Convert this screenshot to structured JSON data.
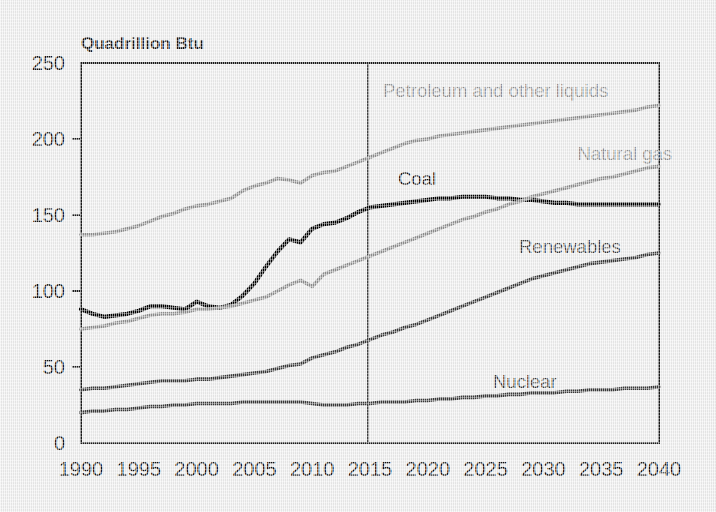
{
  "figure": {
    "axis_title": "Quadrillion Btu",
    "background_color": "#ececec",
    "frame_color": "#1a1a1a"
  },
  "chart_data": {
    "type": "line",
    "title": "Quadrillion Btu",
    "xlabel": "",
    "ylabel": "Quadrillion Btu",
    "xlim": [
      1990,
      2040
    ],
    "ylim": [
      0,
      250
    ],
    "grid": false,
    "legend_position": "inline-annotations",
    "projection_divider_x": 2015,
    "xticks": [
      "1990",
      "1995",
      "2000",
      "2005",
      "2010",
      "2015",
      "2020",
      "2025",
      "2030",
      "2035",
      "2040"
    ],
    "yticks": [
      "0",
      "50",
      "100",
      "150",
      "200",
      "250"
    ],
    "x": [
      1990,
      1991,
      1992,
      1993,
      1994,
      1995,
      1996,
      1997,
      1998,
      1999,
      2000,
      2001,
      2002,
      2003,
      2004,
      2005,
      2006,
      2007,
      2008,
      2009,
      2010,
      2011,
      2012,
      2013,
      2014,
      2015,
      2016,
      2017,
      2018,
      2019,
      2020,
      2021,
      2022,
      2023,
      2024,
      2025,
      2026,
      2027,
      2028,
      2029,
      2030,
      2031,
      2032,
      2033,
      2034,
      2035,
      2036,
      2037,
      2038,
      2039,
      2040
    ],
    "series": [
      {
        "name": "Petroleum and other liquids",
        "label": "Petroleum and other liquids",
        "color": "#8f8f8f",
        "label_x": 383,
        "label_y": 97,
        "label_anchor": "start",
        "values": [
          137,
          137,
          138,
          139,
          141,
          143,
          146,
          149,
          151,
          154,
          156,
          157,
          159,
          161,
          166,
          169,
          171,
          174,
          173,
          171,
          176,
          178,
          179,
          182,
          185,
          188,
          191,
          194,
          197,
          199,
          200,
          202,
          203,
          204,
          205,
          206,
          207,
          208,
          209,
          210,
          211,
          212,
          213,
          214,
          215,
          216,
          217,
          218,
          219,
          221,
          222
        ]
      },
      {
        "name": "Coal",
        "label": "Coal",
        "color": "#000000",
        "label_x": 398,
        "label_y": 185,
        "label_anchor": "start",
        "values": [
          88,
          85,
          83,
          84,
          85,
          87,
          90,
          90,
          89,
          88,
          93,
          90,
          89,
          91,
          97,
          105,
          116,
          126,
          134,
          132,
          141,
          144,
          145,
          148,
          152,
          155,
          156,
          157,
          158,
          159,
          160,
          161,
          161,
          162,
          162,
          162,
          161,
          161,
          160,
          160,
          159,
          158,
          158,
          157,
          157,
          157,
          157,
          157,
          157,
          157,
          157
        ]
      },
      {
        "name": "Natural gas",
        "label": "Natural gas",
        "color": "#8f8f8f",
        "label_x": 672,
        "label_y": 160,
        "label_anchor": "end",
        "values": [
          75,
          76,
          77,
          79,
          80,
          82,
          84,
          85,
          85,
          86,
          88,
          88,
          89,
          90,
          92,
          94,
          96,
          100,
          104,
          107,
          103,
          111,
          114,
          117,
          120,
          123,
          126,
          129,
          132,
          135,
          138,
          141,
          144,
          147,
          149,
          152,
          154,
          157,
          159,
          162,
          164,
          166,
          168,
          170,
          172,
          174,
          175,
          177,
          179,
          181,
          182
        ]
      },
      {
        "name": "Renewables",
        "label": "Renewables",
        "color": "#3a3a3a",
        "label_x": 519,
        "label_y": 253,
        "label_anchor": "start",
        "values": [
          35,
          36,
          36,
          37,
          38,
          39,
          40,
          41,
          41,
          41,
          42,
          42,
          43,
          44,
          45,
          46,
          47,
          49,
          51,
          52,
          56,
          58,
          60,
          63,
          65,
          68,
          71,
          73,
          76,
          78,
          81,
          84,
          87,
          90,
          93,
          96,
          99,
          102,
          105,
          108,
          110,
          112,
          114,
          116,
          118,
          119,
          120,
          121,
          122,
          124,
          125
        ]
      },
      {
        "name": "Nuclear",
        "label": "Nuclear",
        "color": "#3a3a3a",
        "label_x": 493,
        "label_y": 388,
        "label_anchor": "start",
        "values": [
          20,
          21,
          21,
          22,
          22,
          23,
          24,
          24,
          25,
          25,
          26,
          26,
          26,
          26,
          27,
          27,
          27,
          27,
          27,
          27,
          26,
          25,
          25,
          25,
          26,
          26,
          27,
          27,
          27,
          28,
          28,
          29,
          29,
          30,
          30,
          31,
          31,
          32,
          32,
          33,
          33,
          33,
          34,
          34,
          35,
          35,
          35,
          36,
          36,
          36,
          37
        ]
      }
    ]
  }
}
